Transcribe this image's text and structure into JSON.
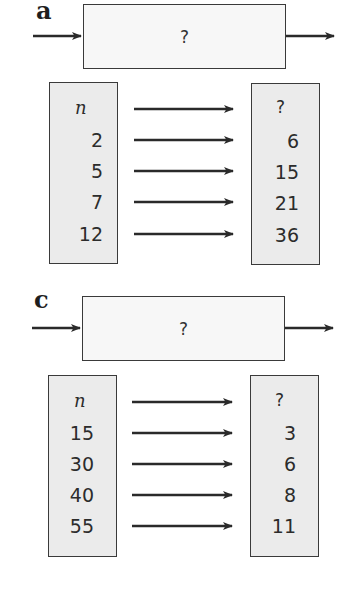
{
  "diagrams": [
    {
      "label": "a",
      "machine": "?",
      "header_in": "n",
      "header_out": "?",
      "inputs": [
        "2",
        "5",
        "7",
        "12"
      ],
      "outputs": [
        "6",
        "15",
        "21",
        "36"
      ]
    },
    {
      "label": "c",
      "machine": "?",
      "header_in": "n",
      "header_out": "?",
      "inputs": [
        "15",
        "30",
        "40",
        "55"
      ],
      "outputs": [
        "3",
        "6",
        "8",
        "11"
      ]
    }
  ],
  "colors": {
    "box_fill": "#ebebeb",
    "machine_fill": "#f7f7f7",
    "stroke": "#3a3a3a"
  }
}
